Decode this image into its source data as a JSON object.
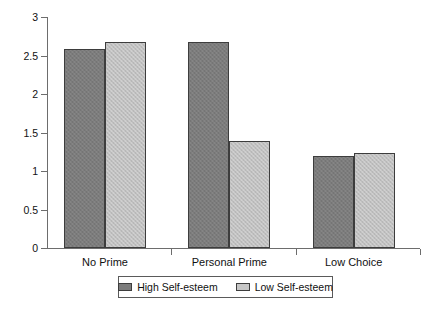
{
  "chart_data": {
    "type": "bar",
    "title": "",
    "subtitle": "",
    "xlabel": "",
    "ylabel": "",
    "categories": [
      "No Prime",
      "Personal Prime",
      "Low Choice"
    ],
    "series": [
      {
        "name": "High Self-esteem",
        "values": [
          2.58,
          2.68,
          1.2
        ],
        "color": "#7c7c7c"
      },
      {
        "name": "Low Self-esteem",
        "values": [
          2.68,
          1.39,
          1.24
        ],
        "color": "#bfbfbf"
      }
    ],
    "ylim": [
      0,
      3
    ],
    "ytick_labels": [
      "0",
      "0.5",
      "1",
      "1.5",
      "2",
      "2.5",
      "3"
    ],
    "ytick_values": [
      0,
      0.5,
      1,
      1.5,
      2,
      2.5,
      3
    ],
    "grid": false,
    "legend_position": "bottom",
    "legend_entries": [
      "High Self-esteem",
      "Low Self-esteem"
    ],
    "annotations": []
  },
  "axis": {
    "y_ticks": [
      {
        "label": "3",
        "value": 3
      },
      {
        "label": "2.5",
        "value": 2.5
      },
      {
        "label": "2",
        "value": 2
      },
      {
        "label": "1.5",
        "value": 1.5
      },
      {
        "label": "1",
        "value": 1
      },
      {
        "label": "0.5",
        "value": 0.5
      },
      {
        "label": "0",
        "value": 0
      }
    ],
    "x_categories": [
      {
        "label": "No Prime"
      },
      {
        "label": "Personal Prime"
      },
      {
        "label": "Low Choice"
      }
    ]
  },
  "legend": {
    "items": [
      {
        "label": "High Self-esteem",
        "series": "high"
      },
      {
        "label": "Low Self-esteem",
        "series": "low"
      }
    ]
  }
}
